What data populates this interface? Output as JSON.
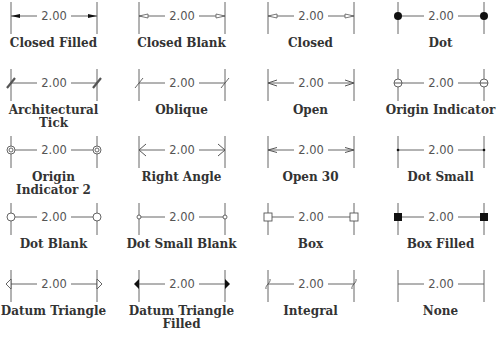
{
  "figure": {
    "dimension_value": "2.00",
    "colors": {
      "line": "#555555",
      "fill": "#111111",
      "label": "#333333"
    },
    "grid": {
      "columns": 4,
      "rows": 5
    },
    "items": [
      {
        "label": "Closed Filled",
        "label_lines": [
          "Closed Filled"
        ],
        "arrow": "closed-filled"
      },
      {
        "label": "Closed Blank",
        "label_lines": [
          "Closed Blank"
        ],
        "arrow": "closed-blank"
      },
      {
        "label": "Closed",
        "label_lines": [
          "Closed"
        ],
        "arrow": "closed"
      },
      {
        "label": "Dot",
        "label_lines": [
          "Dot"
        ],
        "arrow": "dot"
      },
      {
        "label": "Architectural Tick",
        "label_lines": [
          "Architectural",
          "Tick"
        ],
        "arrow": "architectural-tick"
      },
      {
        "label": "Oblique",
        "label_lines": [
          "Oblique"
        ],
        "arrow": "oblique"
      },
      {
        "label": "Open",
        "label_lines": [
          "Open"
        ],
        "arrow": "open"
      },
      {
        "label": "Origin Indicator",
        "label_lines": [
          "Origin Indicator"
        ],
        "arrow": "origin-indicator"
      },
      {
        "label": "Origin Indicator 2",
        "label_lines": [
          "Origin",
          "Indicator 2"
        ],
        "arrow": "origin-indicator-2"
      },
      {
        "label": "Right Angle",
        "label_lines": [
          "Right Angle"
        ],
        "arrow": "right-angle"
      },
      {
        "label": "Open 30",
        "label_lines": [
          "Open 30"
        ],
        "arrow": "open-30"
      },
      {
        "label": "Dot Small",
        "label_lines": [
          "Dot Small"
        ],
        "arrow": "dot-small"
      },
      {
        "label": "Dot Blank",
        "label_lines": [
          "Dot Blank"
        ],
        "arrow": "dot-blank"
      },
      {
        "label": "Dot Small Blank",
        "label_lines": [
          "Dot Small Blank"
        ],
        "arrow": "dot-small-blank"
      },
      {
        "label": "Box",
        "label_lines": [
          "Box"
        ],
        "arrow": "box"
      },
      {
        "label": "Box Filled",
        "label_lines": [
          "Box Filled"
        ],
        "arrow": "box-filled"
      },
      {
        "label": "Datum Triangle",
        "label_lines": [
          "Datum Triangle"
        ],
        "arrow": "datum-triangle"
      },
      {
        "label": "Datum Triangle Filled",
        "label_lines": [
          "Datum Triangle",
          "Filled"
        ],
        "arrow": "datum-triangle-filled"
      },
      {
        "label": "Integral",
        "label_lines": [
          "Integral"
        ],
        "arrow": "integral"
      },
      {
        "label": "None",
        "label_lines": [
          "None"
        ],
        "arrow": "none"
      }
    ]
  }
}
